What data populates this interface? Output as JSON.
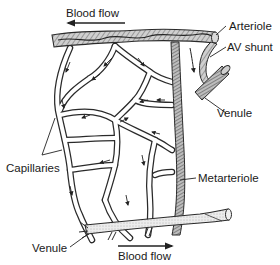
{
  "diagram": {
    "type": "microcirculation capillary bed",
    "labels": {
      "blood_flow_top": "Blood flow",
      "arteriole": "Arteriole",
      "av_shunt": "AV shunt",
      "venule_right": "Venule",
      "capillaries": "Capillaries",
      "metarteriole": "Metarteriole",
      "venule_bottom": "Venule",
      "blood_flow_bottom": "Blood flow"
    },
    "flow_directions": {
      "top": "left",
      "bottom": "right"
    },
    "colors": {
      "line": "#2a2a2a",
      "vessel_fill": "#c8c8c8",
      "venule_fill": "#e6e6e6",
      "background": "#ffffff"
    }
  }
}
